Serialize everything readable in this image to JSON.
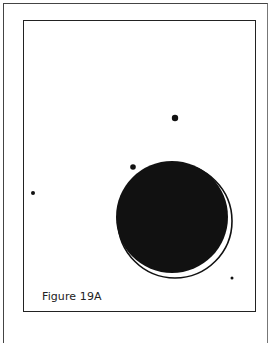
{
  "figure": {
    "caption": "Figure 19A",
    "colors": {
      "ink": "#111111",
      "frame": "#222222",
      "background": "#ffffff"
    },
    "shapes": {
      "large_filled_circle": {
        "cx": 172,
        "cy": 217,
        "r": 56
      },
      "outline_ring": {
        "cx": 175,
        "cy": 221,
        "r": 57
      },
      "dots": [
        {
          "cx": 175,
          "cy": 118,
          "r": 3.2
        },
        {
          "cx": 133,
          "cy": 167,
          "r": 2.8
        },
        {
          "cx": 33,
          "cy": 193,
          "r": 2
        },
        {
          "cx": 232,
          "cy": 278,
          "r": 1.5
        }
      ]
    }
  }
}
